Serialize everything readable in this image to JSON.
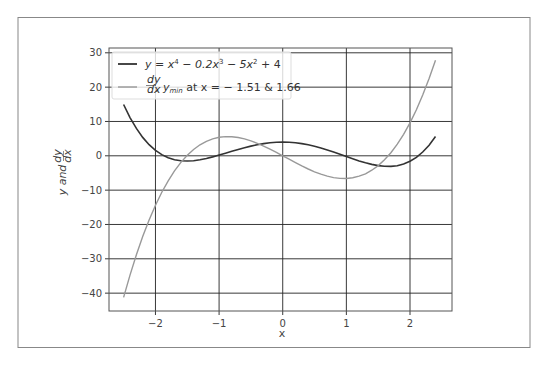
{
  "chart_data": {
    "type": "line",
    "title": "",
    "xlabel": "x",
    "ylabel": "y and dy/dx",
    "xlim": [
      -2.73,
      2.66
    ],
    "ylim": [
      -45.2,
      31.4
    ],
    "grid": true,
    "legend_position": "upper left",
    "x_ticks": [
      -2,
      -1,
      0,
      1,
      2
    ],
    "x_tick_labels": [
      "−2",
      "−1",
      "0",
      "1",
      "2"
    ],
    "y_ticks": [
      30,
      20,
      10,
      0,
      -10,
      -20,
      -30,
      -40
    ],
    "y_tick_labels": [
      "30",
      "20",
      "10",
      "0",
      "−10",
      "−20",
      "−30",
      "−40"
    ],
    "x": [
      -2.5,
      -2.4,
      -2.3,
      -2.2,
      -2.1,
      -2.0,
      -1.9,
      -1.8,
      -1.7,
      -1.6,
      -1.5,
      -1.4,
      -1.3,
      -1.2,
      -1.1,
      -1.0,
      -0.9,
      -0.8,
      -0.7,
      -0.6,
      -0.5,
      -0.4,
      -0.3,
      -0.2,
      -0.1,
      0.0,
      0.1,
      0.2,
      0.3,
      0.4,
      0.5,
      0.6,
      0.7,
      0.8,
      0.9,
      1.0,
      1.1,
      1.2,
      1.3,
      1.4,
      1.5,
      1.6,
      1.7,
      1.8,
      1.9,
      2.0,
      2.1,
      2.2,
      2.3,
      2.4
    ],
    "series": [
      {
        "name": "y = x^4 - 0.2x^3 - 5x^2 + 4",
        "color": "#333333",
        "values": [
          14.94,
          11.14,
          7.97,
          5.36,
          3.25,
          1.6,
          0.35,
          -0.54,
          -1.12,
          -1.43,
          -1.51,
          -1.41,
          -1.15,
          -0.78,
          -0.32,
          0.2,
          0.75,
          1.31,
          1.86,
          2.37,
          2.84,
          3.24,
          3.56,
          3.8,
          3.95,
          4.0,
          3.95,
          3.8,
          3.55,
          3.21,
          2.79,
          2.29,
          1.72,
          1.11,
          0.46,
          -0.2,
          -0.85,
          -1.47,
          -2.03,
          -2.51,
          -2.86,
          -3.07,
          -3.08,
          -2.87,
          -2.39,
          -1.6,
          -0.45,
          1.1,
          3.1,
          5.61
        ]
      },
      {
        "name": "dy/dx, y_min at x = -1.51 & 1.66",
        "color": "#999999",
        "values": [
          -41.25,
          -34.75,
          -28.84,
          -23.5,
          -18.69,
          -14.4,
          -10.6,
          -7.27,
          -4.39,
          -1.92,
          0.15,
          1.85,
          3.2,
          4.22,
          4.95,
          5.4,
          5.6,
          5.57,
          5.33,
          4.92,
          4.35,
          3.65,
          2.84,
          1.94,
          0.99,
          0.0,
          -1.0,
          -1.99,
          -2.95,
          -3.84,
          -4.65,
          -5.35,
          -5.92,
          -6.34,
          -6.57,
          -6.6,
          -6.4,
          -5.95,
          -5.23,
          -4.2,
          -2.85,
          -1.15,
          0.92,
          3.38,
          6.27,
          9.6,
          13.4,
          17.69,
          22.49,
          27.84
        ]
      }
    ]
  },
  "legend": {
    "entries": [
      {
        "label_prefix": "y = x",
        "sup1": "4",
        "mid1": " − 0.2x",
        "sup2": "3",
        "mid2": " − 5x",
        "sup3": "2",
        "suffix": " + 4",
        "color": "#333333"
      },
      {
        "frac_num": "dy",
        "frac_den": "dx",
        "label": ",  y",
        "sub": "min",
        "rest": "  at  x = − 1.51  &  1.66",
        "color": "#999999"
      }
    ]
  },
  "axes": {
    "xlabel": "x",
    "ylabel_main": "y  and ",
    "ylabel_num": "dy",
    "ylabel_den": "dx"
  },
  "colors": {
    "grid": "#222222",
    "frame": "#555555",
    "outer_frame": "#888888"
  }
}
